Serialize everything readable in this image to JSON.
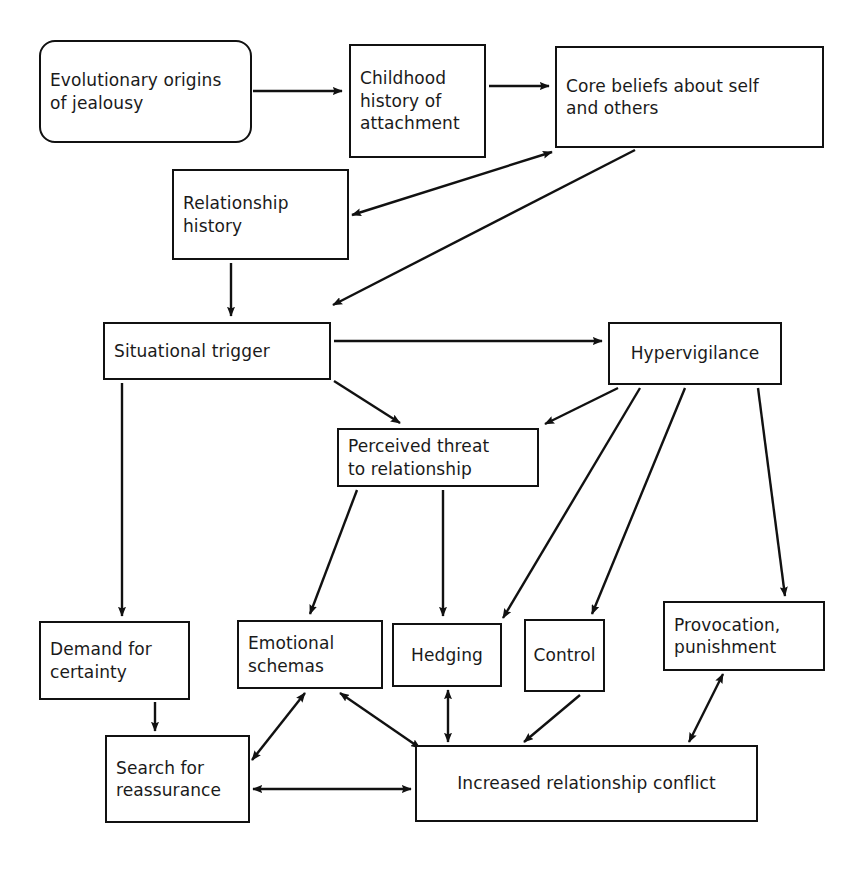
{
  "diagram": {
    "type": "flowchart",
    "stroke_color": "#111111",
    "background_color": "#ffffff",
    "nodes": [
      {
        "id": "evolutionary",
        "label": "Evolutionary origins\nof jealousy",
        "shape": "rounded-rectangle",
        "x": 39,
        "y": 40,
        "w": 213,
        "h": 103
      },
      {
        "id": "childhood",
        "label": "Childhood\nhistory of\nattachment",
        "shape": "rectangle",
        "x": 349,
        "y": 44,
        "w": 137,
        "h": 114
      },
      {
        "id": "core_beliefs",
        "label": "Core beliefs about self\nand others",
        "shape": "rectangle",
        "x": 555,
        "y": 46,
        "w": 269,
        "h": 102
      },
      {
        "id": "rel_history",
        "label": "Relationship\nhistory",
        "shape": "rectangle",
        "x": 172,
        "y": 169,
        "w": 177,
        "h": 91
      },
      {
        "id": "sit_trigger",
        "label": "Situational trigger",
        "shape": "rectangle",
        "x": 103,
        "y": 322,
        "w": 228,
        "h": 58
      },
      {
        "id": "hypervigilance",
        "label": "Hypervigilance",
        "shape": "rectangle",
        "x": 608,
        "y": 322,
        "w": 174,
        "h": 63
      },
      {
        "id": "perceived",
        "label": "Perceived threat\nto relationship",
        "shape": "rectangle",
        "x": 337,
        "y": 428,
        "w": 202,
        "h": 59
      },
      {
        "id": "demand",
        "label": "Demand for\ncertainty",
        "shape": "rectangle",
        "x": 39,
        "y": 621,
        "w": 151,
        "h": 79
      },
      {
        "id": "emotional",
        "label": "Emotional\nschemas",
        "shape": "rectangle",
        "x": 237,
        "y": 620,
        "w": 146,
        "h": 69
      },
      {
        "id": "hedging",
        "label": "Hedging",
        "shape": "rectangle",
        "x": 392,
        "y": 623,
        "w": 110,
        "h": 64
      },
      {
        "id": "control",
        "label": "Control",
        "shape": "rectangle",
        "x": 524,
        "y": 619,
        "w": 81,
        "h": 73
      },
      {
        "id": "provocation",
        "label": "Provocation,\npunishment",
        "shape": "rectangle",
        "x": 663,
        "y": 601,
        "w": 162,
        "h": 70
      },
      {
        "id": "search",
        "label": "Search for\nreassurance",
        "shape": "rectangle",
        "x": 105,
        "y": 735,
        "w": 145,
        "h": 88
      },
      {
        "id": "conflict",
        "label": "Increased relationship conflict",
        "shape": "rectangle",
        "x": 415,
        "y": 745,
        "w": 343,
        "h": 77
      }
    ],
    "edges": [
      {
        "id": "e1",
        "from": "evolutionary",
        "to": "childhood",
        "arrow": "single"
      },
      {
        "id": "e2",
        "from": "childhood",
        "to": "core_beliefs",
        "arrow": "single"
      },
      {
        "id": "e3",
        "from": "rel_history",
        "to": "core_beliefs",
        "arrow": "double"
      },
      {
        "id": "e4",
        "from": "core_beliefs",
        "to": "sit_trigger",
        "arrow": "single"
      },
      {
        "id": "e5",
        "from": "rel_history",
        "to": "sit_trigger",
        "arrow": "single"
      },
      {
        "id": "e6",
        "from": "sit_trigger",
        "to": "hypervigilance",
        "arrow": "single"
      },
      {
        "id": "e7",
        "from": "sit_trigger",
        "to": "perceived",
        "arrow": "single"
      },
      {
        "id": "e8",
        "from": "hypervigilance",
        "to": "perceived",
        "arrow": "single"
      },
      {
        "id": "e9",
        "from": "sit_trigger",
        "to": "demand",
        "arrow": "single"
      },
      {
        "id": "e10",
        "from": "perceived",
        "to": "emotional",
        "arrow": "single"
      },
      {
        "id": "e11",
        "from": "perceived",
        "to": "hedging",
        "arrow": "single"
      },
      {
        "id": "e12",
        "from": "hypervigilance",
        "to": "hedging",
        "arrow": "single"
      },
      {
        "id": "e13",
        "from": "hypervigilance",
        "to": "control",
        "arrow": "single"
      },
      {
        "id": "e14",
        "from": "hypervigilance",
        "to": "provocation",
        "arrow": "single"
      },
      {
        "id": "e15",
        "from": "demand",
        "to": "search",
        "arrow": "single"
      },
      {
        "id": "e16",
        "from": "emotional",
        "to": "search",
        "arrow": "double"
      },
      {
        "id": "e17",
        "from": "emotional",
        "to": "conflict",
        "arrow": "double"
      },
      {
        "id": "e18",
        "from": "hedging",
        "to": "conflict",
        "arrow": "double"
      },
      {
        "id": "e19",
        "from": "control",
        "to": "conflict",
        "arrow": "single"
      },
      {
        "id": "e20",
        "from": "provocation",
        "to": "conflict",
        "arrow": "double"
      },
      {
        "id": "e21",
        "from": "search",
        "to": "conflict",
        "arrow": "double"
      }
    ],
    "edge_geometry": {
      "e1": {
        "x1": 253,
        "y1": 91,
        "x2": 342,
        "y2": 91
      },
      "e2": {
        "x1": 489,
        "y1": 86,
        "x2": 549,
        "y2": 86
      },
      "e3": {
        "x1": 352,
        "y1": 215,
        "x2": 552,
        "y2": 152
      },
      "e4": {
        "x1": 635,
        "y1": 150,
        "x2": 333,
        "y2": 305
      },
      "e5": {
        "x1": 231,
        "y1": 263,
        "x2": 231,
        "y2": 316
      },
      "e6": {
        "x1": 334,
        "y1": 341,
        "x2": 602,
        "y2": 341
      },
      "e7": {
        "x1": 334,
        "y1": 381,
        "x2": 400,
        "y2": 423
      },
      "e8": {
        "x1": 618,
        "y1": 388,
        "x2": 545,
        "y2": 424
      },
      "e9": {
        "x1": 122,
        "y1": 383,
        "x2": 122,
        "y2": 616
      },
      "e10": {
        "x1": 357,
        "y1": 490,
        "x2": 310,
        "y2": 614
      },
      "e11": {
        "x1": 443,
        "y1": 490,
        "x2": 443,
        "y2": 616
      },
      "e12": {
        "x1": 640,
        "y1": 388,
        "x2": 503,
        "y2": 618
      },
      "e13": {
        "x1": 685,
        "y1": 388,
        "x2": 592,
        "y2": 614
      },
      "e14": {
        "x1": 758,
        "y1": 388,
        "x2": 785,
        "y2": 596
      },
      "e15": {
        "x1": 155,
        "y1": 702,
        "x2": 155,
        "y2": 731
      },
      "e16": {
        "x1": 305,
        "y1": 693,
        "x2": 252,
        "y2": 760
      },
      "e17": {
        "x1": 340,
        "y1": 693,
        "x2": 420,
        "y2": 748
      },
      "e18": {
        "x1": 448,
        "y1": 690,
        "x2": 448,
        "y2": 742
      },
      "e19": {
        "x1": 580,
        "y1": 695,
        "x2": 524,
        "y2": 742
      },
      "e20": {
        "x1": 723,
        "y1": 674,
        "x2": 689,
        "y2": 742
      },
      "e21": {
        "x1": 253,
        "y1": 789,
        "x2": 411,
        "y2": 789
      }
    }
  }
}
